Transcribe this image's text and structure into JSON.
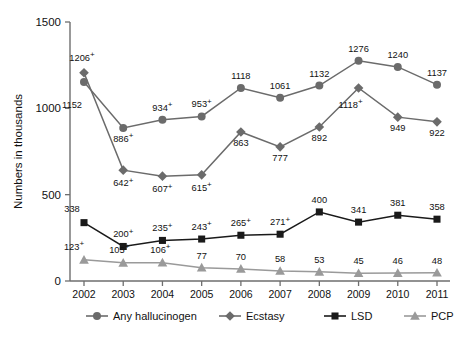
{
  "chart_data": {
    "type": "line",
    "title": "",
    "xlabel": "",
    "ylabel": "Numbers in thousands",
    "categories": [
      "2002",
      "2003",
      "2004",
      "2005",
      "2006",
      "2007",
      "2008",
      "2009",
      "2010",
      "2011"
    ],
    "ylim": [
      0,
      1500
    ],
    "yticks": [
      0,
      500,
      1000,
      1500
    ],
    "grid": false,
    "legend_position": "bottom",
    "annotation_symbol": "+",
    "series": [
      {
        "name": "Any hallucinogen",
        "marker": "circle",
        "color": "#6b6b6b",
        "values": [
          1152,
          886,
          934,
          953,
          1118,
          1061,
          1132,
          1276,
          1240,
          1137
        ],
        "labels": [
          "1152",
          "886",
          "934",
          "953",
          "1118",
          "1061",
          "1132",
          "1276",
          "1240",
          "1137"
        ],
        "flagged": [
          false,
          true,
          true,
          true,
          false,
          false,
          false,
          false,
          false,
          false
        ],
        "label_pos": [
          "below",
          "below",
          "above",
          "above",
          "above",
          "above",
          "above",
          "above",
          "above",
          "above"
        ]
      },
      {
        "name": "Ecstasy",
        "marker": "diamond",
        "color": "#6b6b6b",
        "values": [
          1206,
          642,
          607,
          615,
          863,
          777,
          892,
          1118,
          949,
          922
        ],
        "labels": [
          "1206",
          "642",
          "607",
          "615",
          "863",
          "777",
          "892",
          "1118",
          "949",
          "922"
        ],
        "flagged": [
          true,
          true,
          true,
          true,
          false,
          false,
          false,
          true,
          false,
          false
        ],
        "label_pos": [
          "above",
          "below",
          "below",
          "below",
          "below",
          "below",
          "below",
          "below",
          "below",
          "below"
        ]
      },
      {
        "name": "LSD",
        "marker": "square",
        "color": "#1a1a1a",
        "values": [
          338,
          200,
          235,
          243,
          265,
          271,
          400,
          341,
          381,
          358
        ],
        "labels": [
          "338",
          "200",
          "235",
          "243",
          "265",
          "271",
          "400",
          "341",
          "381",
          "358"
        ],
        "flagged": [
          false,
          true,
          true,
          true,
          true,
          true,
          false,
          false,
          false,
          false
        ],
        "label_pos": [
          "above",
          "above",
          "above",
          "above",
          "above",
          "above",
          "above",
          "above",
          "above",
          "above"
        ]
      },
      {
        "name": "PCP",
        "marker": "triangle",
        "color": "#9a9a9a",
        "values": [
          123,
          105,
          106,
          77,
          70,
          58,
          53,
          45,
          46,
          48
        ],
        "labels": [
          "123",
          "105",
          "106",
          "77",
          "70",
          "58",
          "53",
          "45",
          "46",
          "48"
        ],
        "flagged": [
          true,
          true,
          true,
          false,
          false,
          false,
          false,
          false,
          false,
          false
        ],
        "label_pos": [
          "above",
          "above",
          "above",
          "above",
          "above",
          "above",
          "above",
          "above",
          "above",
          "above"
        ]
      }
    ]
  },
  "legend": {
    "items": [
      {
        "label": "Any hallucinogen",
        "marker": "circle",
        "color": "#6b6b6b"
      },
      {
        "label": "Ecstasy",
        "marker": "diamond",
        "color": "#6b6b6b"
      },
      {
        "label": "LSD",
        "marker": "square",
        "color": "#1a1a1a"
      },
      {
        "label": "PCP",
        "marker": "triangle",
        "color": "#9a9a9a"
      }
    ]
  },
  "caption": {
    "text": ""
  }
}
